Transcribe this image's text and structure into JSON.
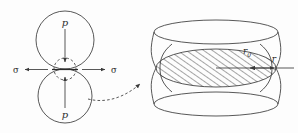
{
  "figure": {
    "background_color": "#fdfdfd",
    "line_color": "#3a3a3a",
    "text_color": "#2b2b2b"
  },
  "left_diagram": {
    "name": "two-circles-contact-diagram",
    "top_circle": {
      "label": "p",
      "label_meaning": "pressure",
      "cx": 65,
      "cy": 40,
      "r": 29
    },
    "bottom_circle": {
      "label": "p",
      "label_meaning": "pressure",
      "cx": 65,
      "cy": 96,
      "r": 27
    },
    "contact_neck": {
      "label": "",
      "cx": 65,
      "cy": 69,
      "r": 11,
      "style": "dashed"
    },
    "left_stress": {
      "label": "σ",
      "label_meaning": "surface tension",
      "direction": "left"
    },
    "right_stress": {
      "label": "σ",
      "label_meaning": "surface tension",
      "direction": "right"
    },
    "top_pressure_arrow": {
      "direction": "down"
    },
    "bottom_pressure_arrow": {
      "direction": "up"
    }
  },
  "connector": {
    "name": "magnify-connector-arrow",
    "style": "dashed-curved-arrow",
    "direction": "up-right"
  },
  "right_diagram": {
    "name": "hyperboloid-neck-diagram",
    "shape": "hyperboloid of one sheet",
    "neck_radius_label": "r",
    "neck_radius_subscript": "0",
    "neck_radius_full": "r₀",
    "curvature_radius_label": "r",
    "hatched_region": {
      "name": "neck-cross-section",
      "hatch_angle_deg": 55,
      "cx": 216,
      "cy": 68,
      "rx": 60,
      "ry": 19
    },
    "top_ellipse": {
      "cx": 216,
      "cy": 32,
      "rx": 62,
      "ry": 12
    },
    "bottom_ellipse": {
      "cx": 216,
      "cy": 104,
      "rx": 62,
      "ry": 12
    },
    "neck_arrow": {
      "direction": "right",
      "from": "center",
      "to": "neck-edge"
    },
    "external_arrow": {
      "direction": "left",
      "label": "r"
    }
  }
}
